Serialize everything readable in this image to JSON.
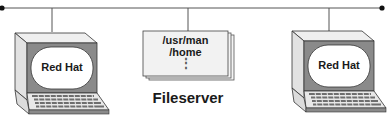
{
  "diagram": {
    "type": "network",
    "network_bus": {
      "left_terminator": "dot",
      "right_terminator": "dot"
    },
    "clients": [
      {
        "id": "left-terminal",
        "screen_label": "Red Hat"
      },
      {
        "id": "right-terminal",
        "screen_label": "Red Hat"
      }
    ],
    "server": {
      "title": "Fileserver",
      "exports": [
        "/usr/man",
        "/home"
      ],
      "more_indicator": "⋮"
    },
    "colors": {
      "line": "#333333",
      "terminal_frame": "#e6e6e6",
      "bezel": "#8a8a8a",
      "screen": "#ffffff",
      "keys": "#6e6e6e",
      "paper": "#f2f2f2"
    }
  }
}
